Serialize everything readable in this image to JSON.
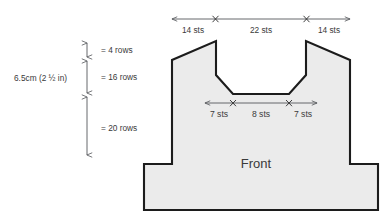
{
  "diagram": {
    "title_label": "Front",
    "fill_color": "#ebebeb",
    "outline_color": "#1c1c1c",
    "text_color": "#3a3a3a",
    "arrow_color": "#55585c"
  },
  "top_ruler": {
    "segments": [
      {
        "label": "14 sts",
        "value": 14,
        "unit": "sts"
      },
      {
        "label": "22 sts",
        "value": 22,
        "unit": "sts"
      },
      {
        "label": "14 sts",
        "value": 14,
        "unit": "sts"
      }
    ],
    "total_label": "50 sts"
  },
  "neckline_ruler": {
    "segments": [
      {
        "label": "7 sts",
        "value": 7,
        "unit": "sts"
      },
      {
        "label": "8 sts",
        "value": 8,
        "unit": "sts"
      },
      {
        "label": "7 sts",
        "value": 7,
        "unit": "sts"
      }
    ]
  },
  "vertical_scale": {
    "overall_label": "6.5cm (2 ½ in)",
    "segments": [
      {
        "label": "= 4 rows",
        "value": 4,
        "unit": "rows"
      },
      {
        "label": "= 16 rows",
        "value": 16,
        "unit": "rows"
      },
      {
        "label": "= 20 rows",
        "value": 20,
        "unit": "rows"
      }
    ]
  }
}
